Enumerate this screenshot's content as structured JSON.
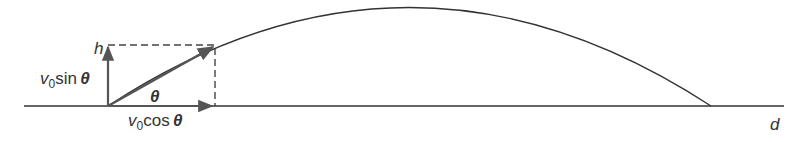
{
  "diagram": {
    "type": "projectile-motion",
    "labels": {
      "height": "h",
      "vertical_component": {
        "v": "v",
        "sub": "0",
        "fn": "sin",
        "angle": "θ"
      },
      "horizontal_component": {
        "v": "v",
        "sub": "0",
        "fn": "cos",
        "angle": "θ"
      },
      "angle": "θ",
      "distance": "d"
    },
    "colors": {
      "line": "#333333",
      "arrow": "#555555",
      "dashed": "#444444"
    }
  }
}
